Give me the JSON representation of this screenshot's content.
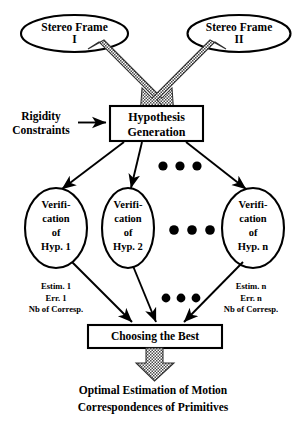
{
  "diagram": {
    "colors": {
      "stroke": "#000000",
      "fill": "#ffffff",
      "thick_arrow": "#777777",
      "background": "#ffffff"
    },
    "inputs": [
      {
        "id": "frame-1",
        "label": "Stereo Frame\nI"
      },
      {
        "id": "frame-2",
        "label": "Stereo Frame\nII"
      }
    ],
    "side_input": {
      "id": "rigidity",
      "label": "Rigidity\nConstraints"
    },
    "process": {
      "id": "hypothesis-generation",
      "label": "Hypothesis\nGeneration"
    },
    "verifications": [
      {
        "id": "verification-1",
        "label": "Verifi-\ncation\nof\nHyp. 1"
      },
      {
        "id": "verification-2",
        "label": "Verifi-\ncation\nof\nHyp. 2"
      },
      {
        "id": "verification-n",
        "label": "Verifi-\ncation\nof\nHyp. n"
      }
    ],
    "estimates": [
      {
        "id": "estimate-1",
        "label": "Estim. 1\nErr. 1\nNb of Corresp."
      },
      {
        "id": "estimate-n",
        "label": "Estim. n\nErr. n\nNb of Corresp."
      }
    ],
    "selector": {
      "id": "choosing-the-best",
      "label": "Choosing the Best"
    },
    "output": {
      "id": "final-output",
      "label": "Optimal Estimation of Motion\nCorrespondences of Primitives"
    },
    "ellipsis": {
      "label": "• • •",
      "occurrences": 3
    }
  }
}
